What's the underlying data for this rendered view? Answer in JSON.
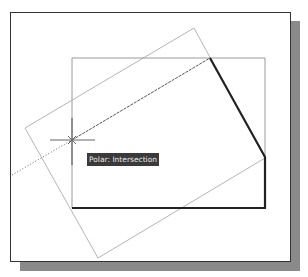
{
  "tooltip": {
    "text": "Polar: Intersection"
  },
  "colors": {
    "thick_line": "#222222",
    "thin_line": "#9a9a9a",
    "rotated_rect": "#b5b5b5",
    "tracking_line": "#555555",
    "crosshair": "#666666",
    "tooltip_bg": "#3a3a3a",
    "tooltip_fg": "#e8e8e8"
  }
}
